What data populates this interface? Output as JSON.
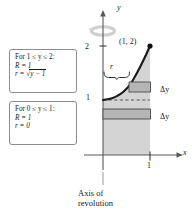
{
  "figure": {
    "type": "math-diagram",
    "axes": {
      "x_label": "x",
      "y_label": "y",
      "x_ticks": [
        {
          "value": "1",
          "label": "1"
        }
      ],
      "y_ticks": [
        {
          "value": "1",
          "label": "1"
        },
        {
          "value": "2",
          "label": "2"
        }
      ]
    },
    "point_label": "(1, 2)",
    "radius_label": "r",
    "slice_labels": {
      "upper": "Δy",
      "lower": "Δy"
    },
    "axis_of_revolution": {
      "line1": "Axis of",
      "line2": "revolution"
    },
    "notes": [
      {
        "id": "upper-interval",
        "condition": "For 1 ≤ y ≤ 2:",
        "outer_radius": "R = 1",
        "inner_radius_prefix": "r = ",
        "inner_radius_radicand": "y − 1",
        "inner_radius_full": "r = √(y − 1)"
      },
      {
        "id": "lower-interval",
        "condition": "For 0 ≤ y ≤ 1:",
        "outer_radius": "R = 1",
        "inner_radius_prefix": "r = 0",
        "inner_radius_radicand": "",
        "inner_radius_full": "r = 0"
      }
    ],
    "colors": {
      "region_fill": "#d4d4d4",
      "slice_fill": "#b5b5b5",
      "curve": "#1a1a1a",
      "axis": "#595959",
      "box_border": "#8c8c8c",
      "rotation_arrow": "#bdbdbd"
    }
  }
}
